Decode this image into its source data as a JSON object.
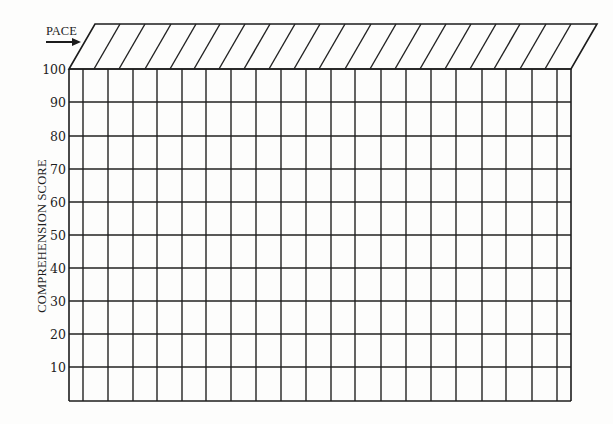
{
  "chart_data": {
    "type": "table",
    "title": "",
    "xlabel": "PACE",
    "ylabel": "COMPREHENSION SCORE",
    "ylim": [
      0,
      100
    ],
    "y_ticks": [
      100,
      90,
      80,
      70,
      60,
      50,
      40,
      30,
      20,
      10
    ],
    "grid": true,
    "columns": 21,
    "pace_header_cells": 20,
    "series": []
  },
  "labels": {
    "pace": "PACE",
    "y_axis_title": "COMPREHENSION SCORE",
    "y_ticks": [
      "100",
      "90",
      "80",
      "70",
      "60",
      "50",
      "40",
      "30",
      "20",
      "10"
    ]
  },
  "layout": {
    "grid_left": 69,
    "grid_right": 571,
    "grid_top": 69,
    "grid_bottom": 401,
    "row_y": [
      69,
      102,
      136,
      169,
      202,
      235,
      268,
      301,
      334,
      367,
      401
    ],
    "col_x": [
      69,
      83,
      108,
      133,
      157,
      182,
      206,
      231,
      256,
      281,
      306,
      331,
      355,
      381,
      406,
      431,
      456,
      482,
      506,
      532,
      557,
      571
    ],
    "header_top": 24,
    "header_skew": 26,
    "slant_x": [
      69,
      94,
      119,
      145,
      170,
      194,
      219,
      244,
      269,
      294,
      319,
      345,
      370,
      395,
      420,
      445,
      470,
      494,
      520,
      545,
      571
    ],
    "line_color": "#222222",
    "background": "#fdfdfc"
  }
}
